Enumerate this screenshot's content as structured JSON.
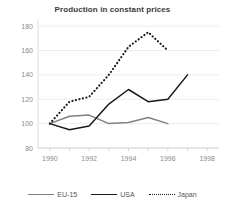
{
  "chart_data": {
    "type": "line",
    "title": "Production in constant prices",
    "xlabel": "",
    "ylabel": "",
    "xlim": [
      1989.4,
      1998.6
    ],
    "ylim": [
      80,
      185
    ],
    "yticks": [
      80,
      100,
      120,
      140,
      160,
      180
    ],
    "xticks": [
      1990,
      1992,
      1994,
      1996,
      1998
    ],
    "xtick_labels": [
      "1990",
      "1992",
      "1994",
      "1996",
      "1998"
    ],
    "ytick_labels": [
      "80",
      "100",
      "120",
      "140",
      "160",
      "180"
    ],
    "xminor_ticks": [
      1990,
      1991,
      1992,
      1993,
      1994,
      1995,
      1996,
      1997,
      1998
    ],
    "grid": "horizontal",
    "legend_position": "bottom",
    "series": [
      {
        "name": "EU-15",
        "style": "solid",
        "color": "#808080",
        "x": [
          1990,
          1991,
          1992,
          1993,
          1994,
          1995,
          1996
        ],
        "values": [
          100,
          106,
          107,
          100,
          101,
          105,
          100
        ]
      },
      {
        "name": "USA",
        "style": "solid",
        "color": "#1a1a1a",
        "x": [
          1990,
          1991,
          1992,
          1993,
          1994,
          1995,
          1996,
          1997
        ],
        "values": [
          100,
          95,
          98,
          116,
          128,
          118,
          120,
          140
        ]
      },
      {
        "name": "Japan",
        "style": "dotted",
        "color": "#1a1a1a",
        "x": [
          1990,
          1991,
          1992,
          1993,
          1994,
          1995,
          1996
        ],
        "values": [
          100,
          118,
          122,
          140,
          163,
          175,
          160
        ]
      }
    ]
  },
  "legend": {
    "items": [
      {
        "label": "EU-15",
        "marker": "line-solid-gray-icon"
      },
      {
        "label": "USA",
        "marker": "line-solid-black-icon"
      },
      {
        "label": "Japan",
        "marker": "line-dotted-black-icon"
      }
    ]
  }
}
